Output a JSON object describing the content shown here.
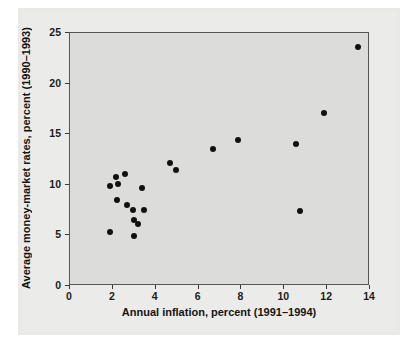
{
  "chart_data": {
    "type": "scatter",
    "title": "",
    "xlabel": "Annual inflation, percent (1991–1994)",
    "ylabel": "Average money-market rates,  percent (1990–1993)",
    "xlim": [
      0,
      14
    ],
    "ylim": [
      0,
      25
    ],
    "xticks": [
      0,
      2,
      4,
      6,
      8,
      10,
      12,
      14
    ],
    "xticklabels": [
      "0",
      "2",
      "4",
      "6",
      "8",
      "10",
      "12",
      "14"
    ],
    "yticks": [
      0,
      5,
      10,
      15,
      20,
      25
    ],
    "yticklabels": [
      "0",
      "5",
      "10",
      "15",
      "20",
      "25"
    ],
    "grid": false,
    "legend": null,
    "marker": {
      "shape": "circle",
      "color": "#111111",
      "size_px": 6
    },
    "plot_area_color": "#dcdcda",
    "frame_color": "#555553",
    "page_color": "#e9e9e7",
    "n_points": 21,
    "points": [
      {
        "x": 1.9,
        "y": 9.8
      },
      {
        "x": 2.2,
        "y": 10.7
      },
      {
        "x": 2.6,
        "y": 11.0
      },
      {
        "x": 2.3,
        "y": 10.0
      },
      {
        "x": 2.25,
        "y": 8.4
      },
      {
        "x": 2.7,
        "y": 7.9
      },
      {
        "x": 3.0,
        "y": 7.4
      },
      {
        "x": 1.9,
        "y": 5.2
      },
      {
        "x": 3.05,
        "y": 6.4
      },
      {
        "x": 3.2,
        "y": 6.0
      },
      {
        "x": 3.05,
        "y": 4.8
      },
      {
        "x": 3.4,
        "y": 9.6
      },
      {
        "x": 3.5,
        "y": 7.4
      },
      {
        "x": 4.7,
        "y": 12.1
      },
      {
        "x": 5.0,
        "y": 11.4
      },
      {
        "x": 6.7,
        "y": 13.4
      },
      {
        "x": 7.9,
        "y": 14.3
      },
      {
        "x": 10.6,
        "y": 13.9
      },
      {
        "x": 10.8,
        "y": 7.3
      },
      {
        "x": 11.9,
        "y": 17.0
      },
      {
        "x": 13.5,
        "y": 23.5
      }
    ]
  }
}
